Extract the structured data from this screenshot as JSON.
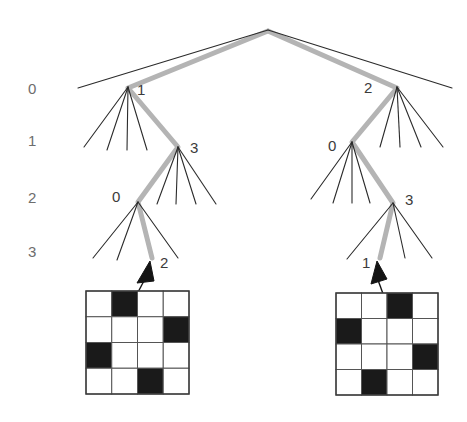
{
  "figure": {
    "background_color": "#ffffff",
    "edge_color": "#2b2b2b",
    "highlight_color": "#b4b4b4",
    "label_color": "#6d6d6d",
    "node_label_color": "#3b3b3b",
    "grid_fill_black": "#1a1a1a",
    "grid_fill_white": "#ffffff",
    "grid_line_color": "#555555"
  },
  "levels": [
    {
      "label": "0",
      "x": 28,
      "y": 94
    },
    {
      "label": "1",
      "x": 28,
      "y": 146
    },
    {
      "label": "2",
      "x": 28,
      "y": 203
    },
    {
      "label": "3",
      "x": 28,
      "y": 257
    }
  ],
  "node_labels": [
    {
      "name": "left-level0-node",
      "text": "1",
      "x": 137,
      "y": 95
    },
    {
      "name": "left-level1-node",
      "text": "3",
      "x": 190,
      "y": 153
    },
    {
      "name": "left-level2-node",
      "text": "0",
      "x": 112,
      "y": 202
    },
    {
      "name": "left-leaf-node",
      "text": "2",
      "x": 160,
      "y": 268
    },
    {
      "name": "right-level0-node",
      "text": "2",
      "x": 364,
      "y": 93
    },
    {
      "name": "right-level1-node",
      "text": "0",
      "x": 328,
      "y": 151
    },
    {
      "name": "right-level2-node",
      "text": "3",
      "x": 405,
      "y": 205
    },
    {
      "name": "right-leaf-node",
      "text": "1",
      "x": 362,
      "y": 268
    }
  ],
  "grids": [
    {
      "name": "left-grid",
      "caption_node": "2",
      "x": 86,
      "y": 291,
      "size": 103,
      "rows": 4,
      "cols": 4,
      "cells": [
        [
          0,
          1,
          0,
          0
        ],
        [
          0,
          0,
          0,
          1
        ],
        [
          1,
          0,
          0,
          0
        ],
        [
          0,
          0,
          1,
          0
        ]
      ]
    },
    {
      "name": "right-grid",
      "caption_node": "1",
      "x": 336,
      "y": 293,
      "size": 102,
      "rows": 4,
      "cols": 4,
      "cells": [
        [
          0,
          0,
          1,
          0
        ],
        [
          1,
          0,
          0,
          0
        ],
        [
          0,
          0,
          0,
          1
        ],
        [
          0,
          1,
          0,
          0
        ]
      ]
    }
  ],
  "tree": {
    "root": {
      "x": 268,
      "y": 30
    },
    "left_branch": {
      "level0": {
        "x": 128,
        "y": 87
      },
      "level1": {
        "x": 178,
        "y": 147
      },
      "level2": {
        "x": 138,
        "y": 202
      },
      "leaf": {
        "x": 152,
        "y": 258
      }
    },
    "right_branch": {
      "level0": {
        "x": 397,
        "y": 87
      },
      "level1": {
        "x": 352,
        "y": 142
      },
      "level2": {
        "x": 393,
        "y": 203
      },
      "leaf": {
        "x": 380,
        "y": 258
      }
    }
  },
  "arrows": [
    {
      "name": "left-arrow",
      "from_x": 127,
      "from_y": 313,
      "to_x": 150,
      "to_y": 266
    },
    {
      "name": "right-arrow",
      "from_x": 390,
      "from_y": 313,
      "to_x": 376,
      "to_y": 266
    }
  ]
}
